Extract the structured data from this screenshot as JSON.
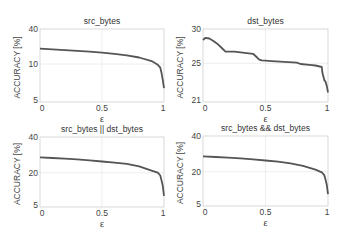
{
  "chart_data": [
    {
      "type": "line",
      "title": "src_bytes",
      "xlabel": "ε",
      "ylabel": "ACCURACY [%]",
      "xlim": [
        0,
        1
      ],
      "xticks": [
        "0",
        "0.5",
        "1"
      ],
      "yticks": [
        "5",
        "10",
        "40"
      ],
      "ytick_frac": [
        0,
        0.52,
        1
      ],
      "grid": true,
      "box": {
        "x": 40,
        "y": 29,
        "w": 124,
        "h": 73
      },
      "series": [
        {
          "name": "src_bytes",
          "x": [
            0,
            0.1,
            0.2,
            0.3,
            0.4,
            0.5,
            0.6,
            0.7,
            0.8,
            0.9,
            0.95,
            0.97,
            0.98,
            0.99,
            1.0
          ],
          "y_frac": [
            0.73,
            0.72,
            0.71,
            0.7,
            0.69,
            0.675,
            0.66,
            0.64,
            0.61,
            0.56,
            0.51,
            0.47,
            0.4,
            0.3,
            0.19
          ]
        }
      ]
    },
    {
      "type": "line",
      "title": "dst_bytes",
      "xlabel": "ε",
      "ylabel": "ACCURACY [%]",
      "xlim": [
        0,
        1
      ],
      "xticks": [
        "0",
        "0.5",
        "1"
      ],
      "yticks": [
        "21",
        "25",
        "30"
      ],
      "ytick_frac": [
        0,
        0.53,
        1
      ],
      "grid": true,
      "box": {
        "x": 203,
        "y": 29,
        "w": 125,
        "h": 73
      },
      "series": [
        {
          "name": "dst_bytes",
          "x": [
            0,
            0.02,
            0.05,
            0.08,
            0.12,
            0.15,
            0.18,
            0.25,
            0.3,
            0.4,
            0.42,
            0.45,
            0.47,
            0.55,
            0.65,
            0.75,
            0.78,
            0.85,
            0.9,
            0.95,
            0.955,
            0.97,
            0.98,
            0.99,
            1.0
          ],
          "y_frac": [
            0.85,
            0.88,
            0.87,
            0.84,
            0.79,
            0.74,
            0.69,
            0.69,
            0.68,
            0.66,
            0.63,
            0.58,
            0.57,
            0.56,
            0.55,
            0.54,
            0.52,
            0.51,
            0.5,
            0.48,
            0.4,
            0.3,
            0.28,
            0.22,
            0.13
          ]
        }
      ]
    },
    {
      "type": "line",
      "title": "src_bytes || dst_bytes",
      "xlabel": "ε",
      "ylabel": "ACCURACY [%]",
      "xlim": [
        0,
        1
      ],
      "xticks": [
        "0",
        "0.5",
        "1"
      ],
      "yticks": [
        "5",
        "20",
        "40"
      ],
      "ytick_frac": [
        0,
        0.49,
        1
      ],
      "grid": true,
      "box": {
        "x": 40,
        "y": 137,
        "w": 124,
        "h": 70
      },
      "series": [
        {
          "name": "src_bytes || dst_bytes",
          "x": [
            0,
            0.1,
            0.2,
            0.3,
            0.4,
            0.5,
            0.6,
            0.7,
            0.8,
            0.9,
            0.95,
            0.97,
            0.98,
            0.99,
            1.0
          ],
          "y_frac": [
            0.71,
            0.7,
            0.69,
            0.68,
            0.665,
            0.65,
            0.635,
            0.615,
            0.58,
            0.52,
            0.49,
            0.45,
            0.38,
            0.3,
            0.16
          ]
        }
      ]
    },
    {
      "type": "line",
      "title": "src_bytes && dst_bytes",
      "xlabel": "ε",
      "ylabel": "ACCURACY [%]",
      "xlim": [
        0,
        1
      ],
      "xticks": [
        "0",
        "0.5",
        "1"
      ],
      "yticks": [
        "5",
        "20",
        "40"
      ],
      "ytick_frac": [
        0,
        0.49,
        1
      ],
      "grid": true,
      "box": {
        "x": 203,
        "y": 136,
        "w": 125,
        "h": 70
      },
      "series": [
        {
          "name": "src_bytes && dst_bytes",
          "x": [
            0,
            0.1,
            0.2,
            0.3,
            0.4,
            0.5,
            0.6,
            0.7,
            0.8,
            0.9,
            0.95,
            0.97,
            0.98,
            0.99,
            1.0
          ],
          "y_frac": [
            0.71,
            0.7,
            0.69,
            0.68,
            0.665,
            0.65,
            0.635,
            0.61,
            0.575,
            0.52,
            0.48,
            0.44,
            0.38,
            0.3,
            0.17
          ]
        }
      ]
    }
  ]
}
